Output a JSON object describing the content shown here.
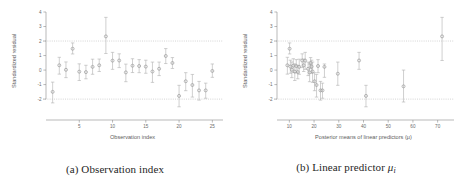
{
  "figure": {
    "panels": [
      {
        "id": "panel-a",
        "caption_prefix": "(a)",
        "caption_text": "Observation index",
        "chart_ref": 0
      },
      {
        "id": "panel-b",
        "caption_prefix": "(b)",
        "caption_text": "Linear predictor",
        "caption_symbol": "μ",
        "caption_subscript": "i",
        "chart_ref": 1
      }
    ]
  },
  "chart_data": [
    {
      "type": "scatter",
      "title": "",
      "xlabel": "Observation index",
      "ylabel": "Standardized residual",
      "xlim": [
        0,
        26
      ],
      "ylim": [
        -2.75,
        4.0
      ],
      "xticks": [
        5,
        10,
        15,
        20,
        25
      ],
      "xticklabels": [
        "5",
        "10",
        "15",
        "20",
        "25"
      ],
      "yticks": [
        -2,
        -1,
        0,
        1,
        2,
        3,
        4
      ],
      "yticklabels": [
        "-2",
        "-1",
        "0",
        "1",
        "2",
        "3",
        "4"
      ],
      "grid": false,
      "legend": "none",
      "reference_lines": [
        {
          "y": 2,
          "style": "dotted"
        },
        {
          "y": -2,
          "style": "dotted"
        }
      ],
      "marker": "open-circle",
      "error_bars": "vertical",
      "x": [
        1,
        2,
        3,
        4,
        5,
        6,
        7,
        8,
        9,
        10,
        11,
        12,
        13,
        14,
        15,
        16,
        17,
        18,
        19,
        20,
        21,
        22,
        23,
        24,
        25
      ],
      "y": [
        -1.5,
        0.33,
        0.02,
        1.47,
        -0.11,
        -0.14,
        0.22,
        0.33,
        2.32,
        0.65,
        0.66,
        -0.16,
        0.3,
        0.28,
        0.24,
        -0.1,
        0.09,
        0.97,
        0.49,
        -1.78,
        -0.77,
        -1.03,
        -1.4,
        -1.4,
        -0.06
      ],
      "y_lower": [
        -2.26,
        -0.28,
        -0.52,
        1.11,
        -0.72,
        -0.6,
        -0.29,
        -0.1,
        1.14,
        0.05,
        0.17,
        -0.8,
        -0.17,
        -0.18,
        -0.22,
        -0.85,
        -0.38,
        0.45,
        0.11,
        -2.53,
        -1.42,
        -1.86,
        -2.07,
        -1.94,
        -0.5
      ],
      "y_upper": [
        -0.83,
        0.88,
        0.56,
        1.87,
        0.43,
        0.33,
        0.75,
        0.76,
        3.63,
        1.22,
        1.12,
        0.41,
        0.78,
        0.72,
        0.68,
        0.55,
        0.55,
        1.48,
        0.86,
        -1.05,
        -0.18,
        -0.3,
        -0.78,
        -0.9,
        0.42
      ]
    },
    {
      "type": "scatter",
      "title": "",
      "xlabel": "Posterior means of linear predictors (μ)",
      "ylabel": "Standardized residual",
      "xlim": [
        5,
        75
      ],
      "ylim": [
        -2.75,
        4.0
      ],
      "xticks": [
        10,
        20,
        30,
        40,
        50,
        60,
        70
      ],
      "xticklabels": [
        "10",
        "20",
        "30",
        "40",
        "50",
        "60",
        "70"
      ],
      "yticks": [
        -2,
        -1,
        0,
        1,
        2,
        3,
        4
      ],
      "yticklabels": [
        "-2",
        "-1",
        "0",
        "1",
        "2",
        "3",
        "4"
      ],
      "grid": false,
      "legend": "none",
      "reference_lines": [
        {
          "y": 2,
          "style": "dotted"
        },
        {
          "y": -2,
          "style": "dotted"
        }
      ],
      "marker": "open-circle",
      "error_bars": "vertical",
      "x": [
        9.2,
        10.1,
        10.4,
        11.0,
        11.6,
        12.2,
        12.8,
        13.4,
        14.0,
        15.2,
        15.8,
        16.4,
        17.6,
        18.2,
        18.6,
        19.0,
        19.4,
        20.2,
        21.0,
        21.6,
        22.6,
        23.4,
        24.2,
        29.6,
        38.2,
        41.0,
        56.2,
        71.8
      ],
      "y": [
        0.33,
        1.47,
        0.24,
        0.02,
        0.3,
        -0.11,
        0.28,
        -0.14,
        0.22,
        0.66,
        0.33,
        0.65,
        0.09,
        -0.16,
        0.49,
        0.24,
        -0.1,
        -0.77,
        -1.03,
        0.28,
        -1.4,
        -1.4,
        0.22,
        -0.25,
        0.66,
        -1.78,
        -1.12,
        2.32
      ],
      "y_lower": [
        -0.28,
        1.11,
        -0.22,
        -0.52,
        -0.17,
        -0.72,
        -0.18,
        -0.6,
        -0.29,
        0.17,
        -0.1,
        0.05,
        -0.38,
        -0.8,
        0.11,
        -0.22,
        -0.85,
        -1.42,
        -1.86,
        -0.18,
        -2.07,
        -1.94,
        -0.5,
        -1.05,
        0.05,
        -2.53,
        -2.2,
        0.66
      ],
      "y_upper": [
        0.88,
        1.87,
        0.68,
        0.56,
        0.78,
        0.43,
        0.72,
        0.33,
        0.75,
        1.12,
        0.76,
        1.22,
        0.55,
        0.41,
        0.86,
        0.68,
        0.55,
        -0.18,
        -0.3,
        0.72,
        -0.78,
        -0.9,
        0.42,
        0.55,
        1.22,
        -1.05,
        0.0,
        3.63
      ]
    }
  ]
}
